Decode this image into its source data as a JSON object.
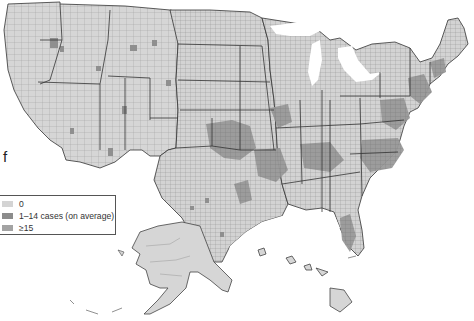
{
  "figure": {
    "panel_label": "f",
    "map_title": "",
    "region": "United States counties",
    "colors": {
      "state_fill_zero": "#d6d6d6",
      "county_border": "#8a8a8a",
      "state_border": "#333333",
      "mid_class": "#8c8c8c",
      "high_class": "#a0a0a0",
      "background": "#ffffff"
    }
  },
  "legend": {
    "items": [
      {
        "label": "0",
        "color": "#d4d4d4"
      },
      {
        "label": "1–14 cases (on average)",
        "color": "#8c8c8c"
      },
      {
        "label": "≥15",
        "color": "#a3a3a3"
      }
    ]
  },
  "insets": {
    "alaska": "Alaska",
    "hawaii": "Hawaii"
  }
}
